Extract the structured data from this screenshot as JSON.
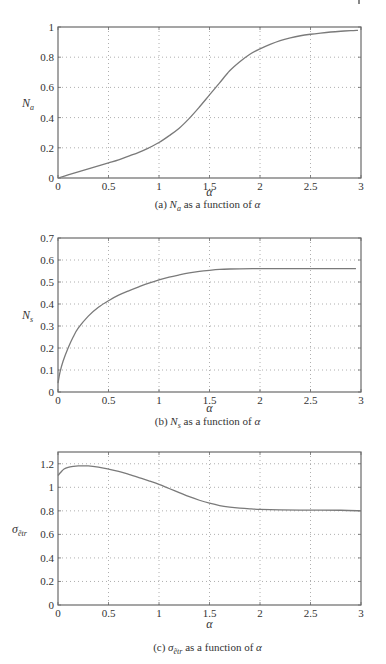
{
  "chart_data": [
    {
      "type": "line",
      "title": "",
      "caption": {
        "prefix": "(a) ",
        "symbol": "N",
        "subscript": "a",
        "suffix": " as a function of ",
        "var": "α"
      },
      "xlabel": "α",
      "ylabel": {
        "symbol": "N",
        "subscript": "a"
      },
      "xlim": [
        0,
        3
      ],
      "ylim": [
        0,
        1
      ],
      "xticks": [
        0,
        0.5,
        1,
        1.5,
        2,
        2.5,
        3
      ],
      "xtick_labels": [
        "0",
        "0.5",
        "1",
        "1.5",
        "2",
        "2.5",
        "3"
      ],
      "yticks": [
        0,
        0.2,
        0.4,
        0.6,
        0.8,
        1
      ],
      "ytick_labels": [
        "0",
        "0.2",
        "0.4",
        "0.6",
        "0.8",
        "1"
      ],
      "grid": true,
      "series": [
        {
          "name": "N_a",
          "x": [
            0,
            0.1,
            0.2,
            0.3,
            0.4,
            0.5,
            0.6,
            0.7,
            0.8,
            0.9,
            1.0,
            1.1,
            1.2,
            1.3,
            1.4,
            1.5,
            1.6,
            1.7,
            1.8,
            1.9,
            2.0,
            2.1,
            2.2,
            2.3,
            2.4,
            2.5,
            2.6,
            2.7,
            2.8,
            2.9,
            2.97
          ],
          "y": [
            0,
            0.02,
            0.04,
            0.06,
            0.08,
            0.1,
            0.12,
            0.145,
            0.17,
            0.2,
            0.235,
            0.28,
            0.33,
            0.395,
            0.47,
            0.55,
            0.63,
            0.71,
            0.77,
            0.82,
            0.855,
            0.885,
            0.91,
            0.928,
            0.942,
            0.952,
            0.96,
            0.967,
            0.972,
            0.976,
            0.978
          ]
        }
      ]
    },
    {
      "type": "line",
      "title": "",
      "caption": {
        "prefix": "(b) ",
        "symbol": "N",
        "subscript": "s",
        "suffix": " as a function of ",
        "var": "α"
      },
      "xlabel": "α",
      "ylabel": {
        "symbol": "N",
        "subscript": "s"
      },
      "xlim": [
        0,
        3
      ],
      "ylim": [
        0,
        0.7
      ],
      "xticks": [
        0,
        0.5,
        1,
        1.5,
        2,
        2.5,
        3
      ],
      "xtick_labels": [
        "0",
        "0.5",
        "1",
        "1.5",
        "2",
        "2.5",
        "3"
      ],
      "yticks": [
        0,
        0.1,
        0.2,
        0.3,
        0.4,
        0.5,
        0.6,
        0.7
      ],
      "ytick_labels": [
        "0",
        "0.1",
        "0.2",
        "0.3",
        "0.4",
        "0.5",
        "0.6",
        "0.7"
      ],
      "grid": true,
      "series": [
        {
          "name": "N_s",
          "x": [
            0,
            0.02,
            0.05,
            0.1,
            0.15,
            0.2,
            0.3,
            0.4,
            0.5,
            0.6,
            0.7,
            0.8,
            0.9,
            1.0,
            1.1,
            1.2,
            1.3,
            1.4,
            1.5,
            1.6,
            1.7,
            1.8,
            2.0,
            2.2,
            2.5,
            2.8,
            2.95
          ],
          "y": [
            0.04,
            0.09,
            0.14,
            0.2,
            0.25,
            0.29,
            0.345,
            0.385,
            0.415,
            0.44,
            0.46,
            0.478,
            0.495,
            0.51,
            0.522,
            0.532,
            0.541,
            0.548,
            0.553,
            0.557,
            0.559,
            0.56,
            0.561,
            0.561,
            0.561,
            0.561,
            0.561
          ]
        }
      ]
    },
    {
      "type": "line",
      "title": "",
      "caption": {
        "prefix": "(c) ",
        "symbol": "σ",
        "subscript": "ẽtr",
        "suffix": " as a function of ",
        "var": "α"
      },
      "xlabel": "α",
      "ylabel": {
        "symbol": "σ",
        "subscript": "ẽtr"
      },
      "xlim": [
        0,
        3
      ],
      "ylim": [
        0,
        1.3
      ],
      "xticks": [
        0,
        0.5,
        1,
        1.5,
        2,
        2.5,
        3
      ],
      "xtick_labels": [
        "0",
        "0.5",
        "1",
        "1.5",
        "2",
        "2.5",
        "3"
      ],
      "yticks": [
        0,
        0.2,
        0.4,
        0.6,
        0.8,
        1,
        1.2
      ],
      "ytick_labels": [
        "0",
        "0.2",
        "0.4",
        "0.6",
        "0.8",
        "1",
        "1.2"
      ],
      "grid": true,
      "series": [
        {
          "name": "sigma_etr",
          "x": [
            0,
            0.03,
            0.06,
            0.1,
            0.15,
            0.2,
            0.3,
            0.4,
            0.5,
            0.6,
            0.7,
            0.8,
            0.9,
            1.0,
            1.1,
            1.2,
            1.3,
            1.4,
            1.5,
            1.6,
            1.7,
            1.8,
            1.9,
            2.0,
            2.2,
            2.5,
            2.8,
            3.0
          ],
          "y": [
            1.1,
            1.13,
            1.155,
            1.17,
            1.178,
            1.182,
            1.182,
            1.172,
            1.155,
            1.135,
            1.11,
            1.083,
            1.055,
            1.025,
            0.99,
            0.955,
            0.92,
            0.89,
            0.865,
            0.845,
            0.832,
            0.823,
            0.817,
            0.813,
            0.809,
            0.806,
            0.805,
            0.8
          ]
        }
      ]
    }
  ]
}
